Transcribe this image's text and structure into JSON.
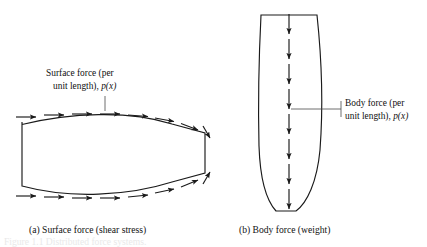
{
  "figure": {
    "panels": [
      {
        "id": "a",
        "caption": "(a)  Surface force (shear stress)",
        "label_line1": "Surface force (per",
        "label_line2_prefix": "unit length), ",
        "label_line2_math": "p(x)",
        "arrow_direction": "rightward",
        "arrow_rows": 2,
        "arrows_per_row": 8,
        "shape": "tapered-lens-horizontal"
      },
      {
        "id": "b",
        "caption": "(b)  Body force (weight)",
        "label_line1": "Body force (per",
        "label_line2_prefix": "unit length), ",
        "label_line2_math": "p(x)",
        "arrow_direction": "downward",
        "arrow_count": 8,
        "shape": "tapered-column-vertical"
      }
    ],
    "cutoff_caption": "Figure 1.1  Distributed force systems.",
    "colors": {
      "ink": "#1a1a1a",
      "leader": "#4a4a4a",
      "background": "#ffffff"
    }
  }
}
